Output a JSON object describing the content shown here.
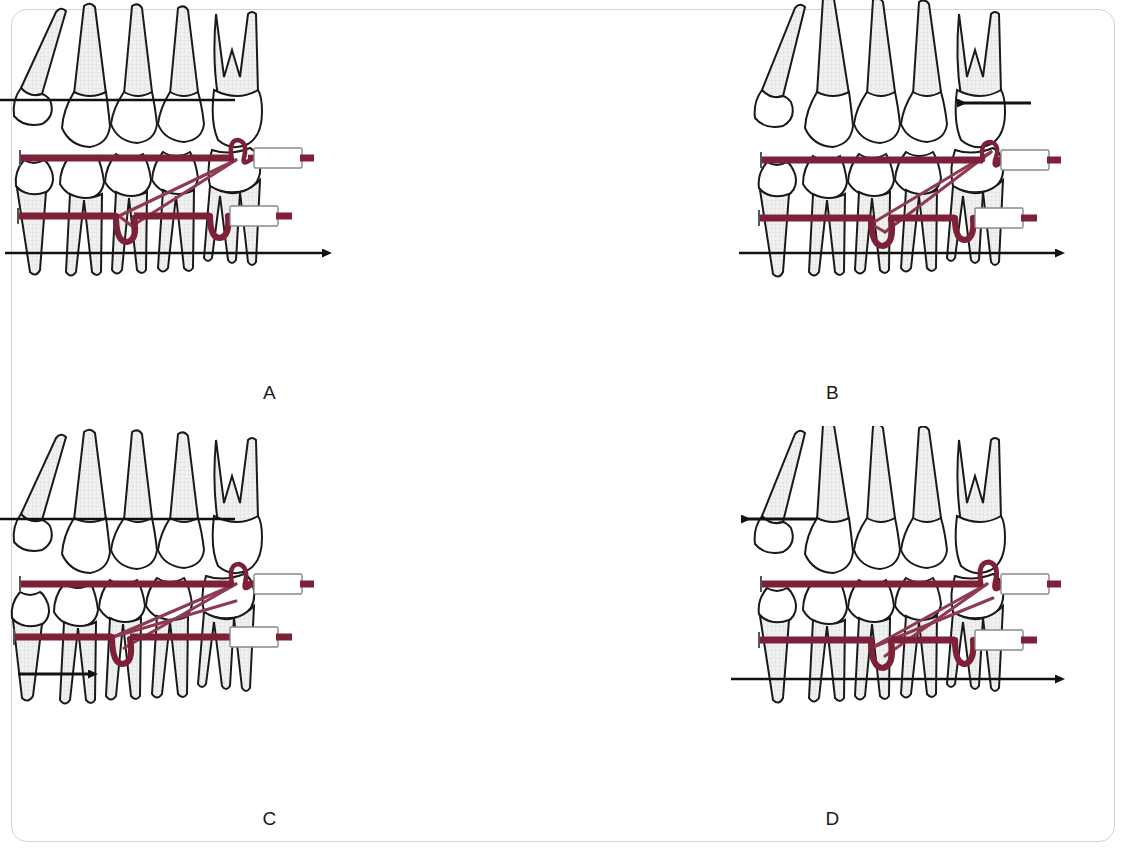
{
  "figure": {
    "kind": "orthodontic-mechanics-diagram",
    "background_color": "#ffffff",
    "border_color": "#e9c9cf",
    "wire_color": "#7d2038",
    "elastic_color": "#8e3a52",
    "tooth_outline_color": "#1a1a1a",
    "root_fill_color": "#eceded",
    "crown_fill_color": "#ffffff",
    "arrow_color": "#111111",
    "appliance_fill_color": "#ffffff",
    "appliance_stroke_color": "#8a8a8a"
  },
  "panels": [
    {
      "id": "panel-a",
      "label": "A",
      "upper_arrow": {
        "name": "upper-retraction-arrow",
        "direction": "left",
        "span": "full-arch",
        "x1": 450,
        "x2": 118,
        "y": 150
      },
      "lower_arrow": {
        "name": "lower-protraction-arrow",
        "direction": "right",
        "span": "full-arch",
        "x1": 118,
        "x2": 430,
        "y": 303
      },
      "elastic_pattern": "narrow-triangle",
      "upper_wire_label": "upper-archwire",
      "lower_wire_label": "lower-archwire",
      "upper_tube_label": "upper-buccal-tube",
      "lower_tube_label": "lower-buccal-tube",
      "upper_hook_label": "upper-molar-hook",
      "lower_loop_label": "lower-vertical-loop"
    },
    {
      "id": "panel-b",
      "label": "B",
      "upper_arrow": {
        "name": "upper-molar-distalizing-arrow",
        "direction": "left",
        "span": "molar-only",
        "x1": 1040,
        "x2": 962,
        "y": 152
      },
      "lower_arrow": {
        "name": "lower-protraction-arrow",
        "direction": "right",
        "span": "full-arch",
        "x1": 688,
        "x2": 1000,
        "y": 303
      },
      "elastic_pattern": "narrow-triangle",
      "upper_wire_label": "upper-archwire",
      "lower_wire_label": "lower-archwire",
      "upper_tube_label": "upper-buccal-tube",
      "lower_tube_label": "lower-buccal-tube",
      "upper_hook_label": "upper-molar-hook",
      "lower_loop_label": "lower-vertical-loop"
    },
    {
      "id": "panel-c",
      "label": "C",
      "upper_arrow": {
        "name": "upper-retraction-arrow",
        "direction": "left",
        "span": "full-arch",
        "x1": 450,
        "x2": 118,
        "y": 533
      },
      "lower_arrow": {
        "name": "lower-incisor-proclination-arrow",
        "direction": "right",
        "span": "incisor-only",
        "x1": 126,
        "x2": 196,
        "y": 688
      },
      "elastic_pattern": "wide-triangle",
      "upper_wire_label": "upper-archwire",
      "lower_wire_label": "lower-archwire",
      "upper_tube_label": "upper-buccal-tube",
      "lower_tube_label": "lower-buccal-tube",
      "upper_hook_label": "upper-molar-hook",
      "lower_loop_label": "lower-vertical-loop"
    },
    {
      "id": "panel-d",
      "label": "D",
      "upper_arrow": {
        "name": "upper-incisor-retraction-arrow",
        "direction": "left",
        "span": "incisor-only",
        "x1": 742,
        "x2": 668,
        "y": 533
      },
      "lower_arrow": {
        "name": "lower-protraction-arrow",
        "direction": "right",
        "span": "full-arch",
        "x1": 680,
        "x2": 1000,
        "y": 688
      },
      "elastic_pattern": "wide-triangle",
      "upper_wire_label": "upper-archwire",
      "lower_wire_label": "lower-archwire",
      "upper_tube_label": "upper-buccal-tube",
      "lower_tube_label": "lower-buccal-tube",
      "upper_hook_label": "upper-molar-hook",
      "lower_loop_label": "lower-vertical-loop"
    }
  ]
}
